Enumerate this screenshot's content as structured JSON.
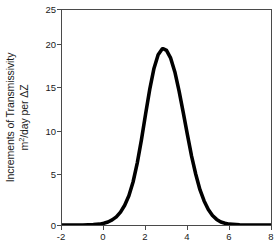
{
  "chart_data": {
    "type": "line",
    "title": "",
    "subtitle": "",
    "xlabel": "",
    "ylabel": "Increments of Transmissivity m²/day per ΔZ",
    "ylabel_line1": "Increments of Transmissivity",
    "ylabel_line2_prefix": "m",
    "ylabel_line2_sup": "2",
    "ylabel_line2_suffix": "/day per ΔZ",
    "xlim": [
      -2,
      8
    ],
    "ylim": [
      0,
      25
    ],
    "xticks": [
      -2,
      0,
      2,
      4,
      6,
      8
    ],
    "xtick_labels": [
      "-2",
      "0",
      "2",
      "4",
      "6",
      "8"
    ],
    "yticks": [
      0,
      5,
      10,
      15,
      20,
      25
    ],
    "ytick_labels": [
      "0",
      "5",
      "10",
      "15",
      "20",
      "25"
    ],
    "grid": false,
    "legend": null,
    "legend_position": "none",
    "series": [
      {
        "name": "Increments of Transmissivity",
        "color": "#000000",
        "line_width": 3.6,
        "x": [
          -2.0,
          -1.5,
          -1.0,
          -0.5,
          -0.2,
          0.0,
          0.2,
          0.4,
          0.6,
          0.8,
          1.0,
          1.2,
          1.4,
          1.6,
          1.8,
          2.0,
          2.2,
          2.4,
          2.6,
          2.8,
          2.85,
          3.0,
          3.2,
          3.4,
          3.6,
          3.8,
          4.0,
          4.2,
          4.4,
          4.6,
          4.8,
          5.0,
          5.2,
          5.4,
          5.6,
          5.8,
          6.0,
          6.5,
          7.0,
          7.5,
          8.0
        ],
        "y": [
          0.0,
          0.0,
          0.0,
          0.05,
          0.1,
          0.2,
          0.35,
          0.6,
          0.95,
          1.5,
          2.3,
          3.4,
          5.0,
          7.2,
          9.9,
          12.9,
          15.8,
          18.2,
          19.8,
          20.5,
          20.5,
          20.3,
          19.4,
          17.8,
          15.6,
          13.1,
          10.5,
          8.0,
          5.9,
          4.1,
          2.8,
          1.8,
          1.1,
          0.65,
          0.35,
          0.2,
          0.1,
          0.03,
          0.0,
          0.0,
          0.0
        ]
      }
    ],
    "peak": {
      "x": 2.85,
      "y": 20.5
    },
    "axes_color": "#4a4a4a",
    "background_color": "#ffffff"
  }
}
